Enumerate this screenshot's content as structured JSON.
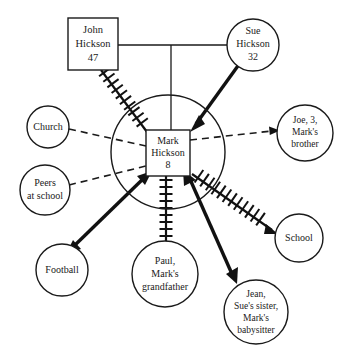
{
  "diagram": {
    "type": "ecomap",
    "background_color": "#ffffff",
    "line_color": "#1a1a1a"
  },
  "nodes": {
    "john": {
      "name": "john-hickson",
      "shape": "square",
      "lines": [
        "John",
        "Hickson",
        "47"
      ]
    },
    "sue": {
      "name": "sue-hickson",
      "shape": "circle",
      "lines": [
        "Sue",
        "Hickson",
        "32"
      ]
    },
    "mark": {
      "name": "mark-hickson",
      "shape": "square",
      "lines": [
        "Mark",
        "Hickson",
        "8"
      ]
    },
    "church": {
      "name": "church",
      "shape": "circle",
      "lines": [
        "Church"
      ]
    },
    "peers": {
      "name": "peers-at-school",
      "shape": "circle",
      "lines": [
        "Peers",
        "at school"
      ]
    },
    "football": {
      "name": "football",
      "shape": "circle",
      "lines": [
        "Football"
      ]
    },
    "paul": {
      "name": "paul-grandfather",
      "shape": "circle",
      "lines": [
        "Paul,",
        "Mark's",
        "grandfather"
      ]
    },
    "jean": {
      "name": "jean-babysitter",
      "shape": "circle",
      "lines": [
        "Jean,",
        "Sue's sister,",
        "Mark's",
        "babysitter"
      ]
    },
    "school": {
      "name": "school",
      "shape": "circle",
      "lines": [
        "School"
      ]
    },
    "joe": {
      "name": "joe-brother",
      "shape": "circle",
      "lines": [
        "Joe, 3,",
        "Mark's",
        "brother"
      ]
    }
  },
  "connections": [
    {
      "from": "john",
      "to": "sue",
      "style": "plain",
      "label": "marriage-line"
    },
    {
      "from": "marriage",
      "to": "mark",
      "style": "plain",
      "label": "child-line"
    },
    {
      "from": "john",
      "to": "mark",
      "style": "hatched",
      "label": "stressful-relationship"
    },
    {
      "from": "sue",
      "to": "mark",
      "style": "strong-arrow",
      "label": "strong-relationship"
    },
    {
      "from": "church",
      "to": "mark",
      "style": "dashed",
      "label": "tenuous-relationship"
    },
    {
      "from": "peers",
      "to": "mark",
      "style": "dashed",
      "label": "tenuous-relationship"
    },
    {
      "from": "mark",
      "to": "joe",
      "style": "dashed-arrow",
      "label": "tenuous-relationship"
    },
    {
      "from": "mark",
      "to": "football",
      "style": "strong-arrow",
      "label": "strong-relationship"
    },
    {
      "from": "mark",
      "to": "paul",
      "style": "hatched",
      "label": "stressful-relationship"
    },
    {
      "from": "mark",
      "to": "jean",
      "style": "strong-arrow",
      "label": "strong-relationship"
    },
    {
      "from": "mark",
      "to": "school",
      "style": "hatched-arrow",
      "label": "stressful-relationship"
    }
  ]
}
